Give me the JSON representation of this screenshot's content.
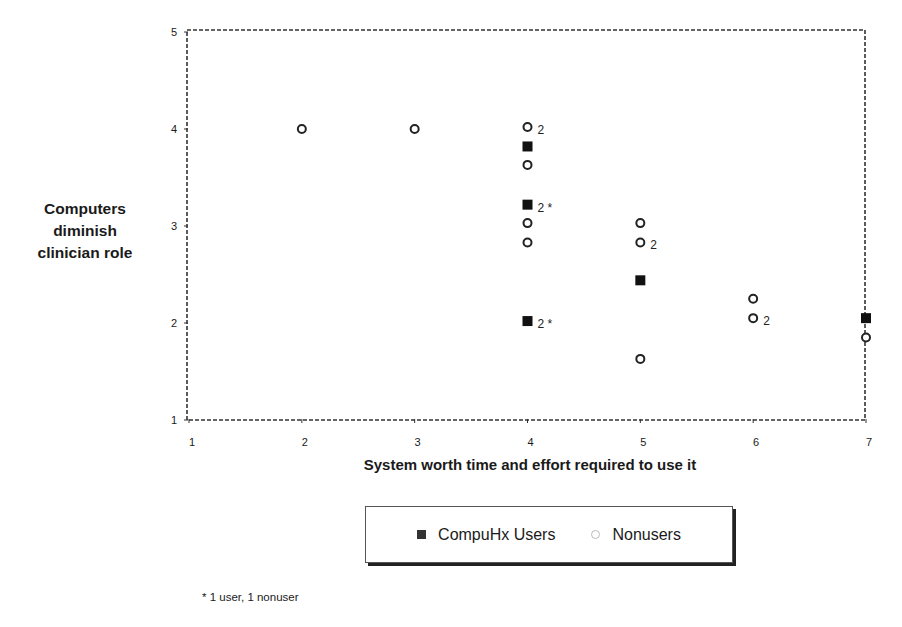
{
  "chart_data": {
    "type": "scatter",
    "title": "",
    "xlabel": "System worth time and effort required to use it",
    "ylabel": "Computers diminish clinician role",
    "xlim": [
      1,
      7
    ],
    "ylim": [
      1,
      5
    ],
    "x_ticks": [
      "1",
      "2",
      "3",
      "4",
      "5",
      "6",
      "7"
    ],
    "y_ticks": [
      "1",
      "2",
      "3",
      "4",
      "5"
    ],
    "grid": false,
    "legend_position": "bottom",
    "series": [
      {
        "name": "CompuHx Users",
        "marker": "filled-square",
        "points": [
          {
            "x": 4,
            "y": 3.82,
            "label": ""
          },
          {
            "x": 4,
            "y": 3.22,
            "label": "2 *"
          },
          {
            "x": 4,
            "y": 2.02,
            "label": "2 *"
          },
          {
            "x": 5,
            "y": 2.44,
            "label": ""
          },
          {
            "x": 7,
            "y": 2.05,
            "label": ""
          }
        ]
      },
      {
        "name": "Nonusers",
        "marker": "open-circle",
        "points": [
          {
            "x": 2,
            "y": 4.0,
            "label": ""
          },
          {
            "x": 3,
            "y": 4.0,
            "label": ""
          },
          {
            "x": 4,
            "y": 4.02,
            "label": "2"
          },
          {
            "x": 4,
            "y": 3.63,
            "label": ""
          },
          {
            "x": 4,
            "y": 3.03,
            "label": ""
          },
          {
            "x": 4,
            "y": 2.83,
            "label": ""
          },
          {
            "x": 5,
            "y": 3.03,
            "label": ""
          },
          {
            "x": 5,
            "y": 2.83,
            "label": "2"
          },
          {
            "x": 5,
            "y": 1.63,
            "label": ""
          },
          {
            "x": 6,
            "y": 2.25,
            "label": ""
          },
          {
            "x": 6,
            "y": 2.05,
            "label": "2"
          },
          {
            "x": 7,
            "y": 1.85,
            "label": ""
          }
        ]
      }
    ],
    "annotations": [
      "* 1 user, 1 nonuser"
    ]
  },
  "axes": {
    "y_label_lines": [
      "Computers",
      "diminish",
      "clinician role"
    ],
    "x_label": "System worth time and effort required to use it"
  },
  "legend": {
    "users_label": "CompuHx Users",
    "nonusers_label": "Nonusers"
  },
  "footnote": "* 1 user, 1 nonuser"
}
